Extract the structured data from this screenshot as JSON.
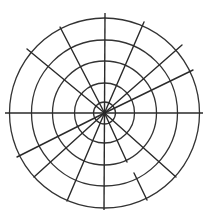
{
  "diagram": {
    "type": "polar-grid",
    "center": {
      "x": 104.5,
      "y": 113
    },
    "stroke_color": "#2a2a2a",
    "background": "#ffffff",
    "rings": [
      {
        "r": 11
      },
      {
        "r": 30
      },
      {
        "r": 52
      },
      {
        "r": 73
      },
      {
        "r": 95
      }
    ],
    "axes": [
      {
        "x1": 5,
        "y1": 113,
        "x2": 203,
        "y2": 113
      },
      {
        "x1": 105,
        "y1": 13,
        "x2": 104,
        "y2": 210
      }
    ],
    "spokes": [
      {
        "x1": 104.5,
        "y1": 113,
        "x2": 60,
        "y2": 27
      },
      {
        "x1": 104.5,
        "y1": 113,
        "x2": 27,
        "y2": 49
      },
      {
        "x1": 104.5,
        "y1": 113,
        "x2": 144,
        "y2": 22
      },
      {
        "x1": 104.5,
        "y1": 113,
        "x2": 182,
        "y2": 45
      },
      {
        "x1": 104.5,
        "y1": 113,
        "x2": 193,
        "y2": 70
      },
      {
        "x1": 104.5,
        "y1": 113,
        "x2": 176,
        "y2": 177
      },
      {
        "x1": 104.5,
        "y1": 113,
        "x2": 127,
        "y2": 162
      },
      {
        "x1": 134,
        "y1": 173,
        "x2": 147,
        "y2": 200
      },
      {
        "x1": 104.5,
        "y1": 113,
        "x2": 17,
        "y2": 157
      },
      {
        "x1": 104.5,
        "y1": 113,
        "x2": 34,
        "y2": 177
      },
      {
        "x1": 104.5,
        "y1": 113,
        "x2": 67,
        "y2": 201
      }
    ]
  }
}
